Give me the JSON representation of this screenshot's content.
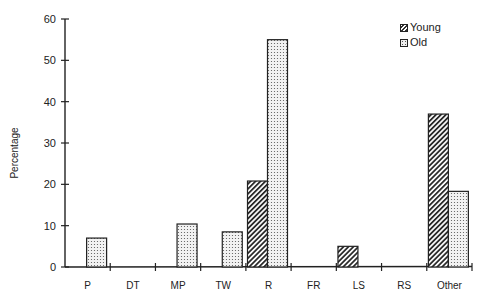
{
  "chart_data": {
    "type": "bar",
    "title": "",
    "xlabel": "",
    "ylabel": "Percentage",
    "ylim": [
      0,
      60
    ],
    "yticks": [
      0,
      10,
      20,
      30,
      40,
      50,
      60
    ],
    "grid": false,
    "legend_position": "top-right",
    "categories": [
      "P",
      "DT",
      "MP",
      "TW",
      "R",
      "FR",
      "LS",
      "RS",
      "Other"
    ],
    "series": [
      {
        "name": "Young",
        "pattern": "diagonal-hatch",
        "values": [
          0,
          0,
          0,
          0,
          20.8,
          0,
          5,
          0,
          37
        ]
      },
      {
        "name": "Old",
        "pattern": "dotted",
        "values": [
          7,
          0,
          10.4,
          8.5,
          55,
          0,
          0,
          0,
          18.3
        ]
      }
    ]
  },
  "legend": {
    "young_label": "Young",
    "old_label": "Old"
  },
  "axis": {
    "ylabel": "Percentage"
  }
}
